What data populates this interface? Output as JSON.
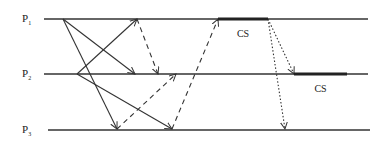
{
  "diagram": {
    "type": "space-time diagram (mutual exclusion message passing)",
    "processes": [
      {
        "id": "P1",
        "label_main": "P",
        "label_sub": "1",
        "y": 19,
        "x_start": 44,
        "x_end": 368
      },
      {
        "id": "P2",
        "label_main": "P",
        "label_sub": "2",
        "y": 74,
        "x_start": 44,
        "x_end": 368
      },
      {
        "id": "P3",
        "label_main": "P",
        "label_sub": "3",
        "y": 130,
        "x_start": 48,
        "x_end": 370
      }
    ],
    "critical_sections": [
      {
        "process": "P1",
        "label": "CS",
        "x_start": 218,
        "x_end": 268
      },
      {
        "process": "P2",
        "label": "CS",
        "x_start": 294,
        "x_end": 347
      }
    ],
    "messages": [
      {
        "from": "P1",
        "to": "P2",
        "x1": 63,
        "y1": 19,
        "x2": 135,
        "y2": 74,
        "style": "solid"
      },
      {
        "from": "P1",
        "to": "P3",
        "x1": 63,
        "y1": 19,
        "x2": 117,
        "y2": 129,
        "style": "solid"
      },
      {
        "from": "P2",
        "to": "P1",
        "x1": 77,
        "y1": 74,
        "x2": 137,
        "y2": 19,
        "style": "solid"
      },
      {
        "from": "P2",
        "to": "P3",
        "x1": 77,
        "y1": 74,
        "x2": 172,
        "y2": 129,
        "style": "solid"
      },
      {
        "from": "P1",
        "to": "P2",
        "x1": 137,
        "y1": 19,
        "x2": 158,
        "y2": 74,
        "style": "dashed"
      },
      {
        "from": "P3",
        "to": "P2",
        "x1": 117,
        "y1": 129,
        "x2": 176,
        "y2": 74,
        "style": "dashed"
      },
      {
        "from": "P3",
        "to": "P1",
        "x1": 172,
        "y1": 129,
        "x2": 218,
        "y2": 19,
        "style": "dashed"
      },
      {
        "from": "P1",
        "to": "P2",
        "x1": 268,
        "y1": 19,
        "x2": 294,
        "y2": 74,
        "style": "dotted"
      },
      {
        "from": "P1",
        "to": "P3",
        "x1": 268,
        "y1": 19,
        "x2": 285,
        "y2": 129,
        "style": "dotted"
      }
    ],
    "colors": {
      "line": "#333333",
      "background": "#ffffff"
    }
  }
}
